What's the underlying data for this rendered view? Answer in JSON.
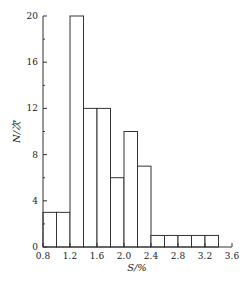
{
  "chart_data": {
    "type": "bar",
    "subtype": "histogram",
    "title": "",
    "xlabel": "S/%",
    "ylabel": "N/次",
    "xlim": [
      0.8,
      3.6
    ],
    "ylim": [
      0,
      20
    ],
    "x_ticks": [
      "0.8",
      "1.2",
      "1.6",
      "2.0",
      "2.4",
      "2.8",
      "3.2",
      "3.6"
    ],
    "y_ticks": [
      "0",
      "4",
      "8",
      "12",
      "16",
      "20"
    ],
    "bin_width": 0.2,
    "bins": [
      {
        "start": 0.8,
        "end": 1.0,
        "value": 3
      },
      {
        "start": 1.0,
        "end": 1.2,
        "value": 3
      },
      {
        "start": 1.2,
        "end": 1.4,
        "value": 20
      },
      {
        "start": 1.4,
        "end": 1.6,
        "value": 12
      },
      {
        "start": 1.6,
        "end": 1.8,
        "value": 12
      },
      {
        "start": 1.8,
        "end": 2.0,
        "value": 6
      },
      {
        "start": 2.0,
        "end": 2.2,
        "value": 10
      },
      {
        "start": 2.2,
        "end": 2.4,
        "value": 7
      },
      {
        "start": 2.4,
        "end": 2.6,
        "value": 1
      },
      {
        "start": 2.6,
        "end": 2.8,
        "value": 1
      },
      {
        "start": 2.8,
        "end": 3.0,
        "value": 1
      },
      {
        "start": 3.0,
        "end": 3.2,
        "value": 1
      },
      {
        "start": 3.2,
        "end": 3.4,
        "value": 1
      }
    ],
    "categories": [
      "0.8-1.0",
      "1.0-1.2",
      "1.2-1.4",
      "1.4-1.6",
      "1.6-1.8",
      "1.8-2.0",
      "2.0-2.2",
      "2.2-2.4",
      "2.4-2.6",
      "2.6-2.8",
      "2.8-3.0",
      "3.0-3.2",
      "3.2-3.4"
    ],
    "values": [
      3,
      3,
      20,
      12,
      12,
      6,
      10,
      7,
      1,
      1,
      1,
      1,
      1
    ],
    "grid": false,
    "legend": null,
    "colors": {
      "bar_fill": "#ffffff",
      "bar_stroke": "#333333",
      "axis": "#333333"
    }
  }
}
